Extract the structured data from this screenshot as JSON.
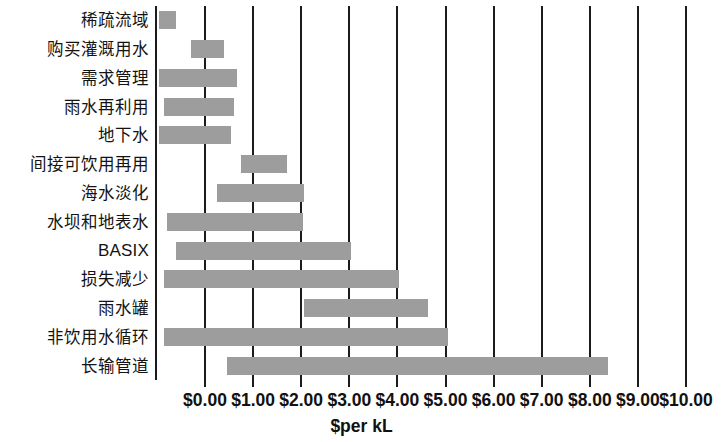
{
  "chart_data": {
    "type": "bar",
    "orientation": "horizontal",
    "title": "",
    "xlabel": "$per kL",
    "ylabel": "",
    "xlim": [
      0,
      10
    ],
    "xticks": [
      0,
      1,
      2,
      3,
      4,
      5,
      6,
      7,
      8,
      9,
      10
    ],
    "xtick_labels": [
      "$0.00",
      "$1.00",
      "$2.00",
      "$3.00",
      "$4.00",
      "$5.00",
      "$6.00",
      "$7.00",
      "$8.00",
      "$9.00",
      "$10.00"
    ],
    "grid": true,
    "grid_axis": "x",
    "legend": false,
    "bar_color": "#9d9d9d",
    "note": "Floating (range) bars: each category spans a low-to-high cost range; some ranges extend below $0.00 and are clipped at the left spine.",
    "categories": [
      "稀疏流域",
      "购买灌溉用水",
      "需求管理",
      "雨水再利用",
      "地下水",
      "间接可饮用再用",
      "海水淡化",
      "水坝和地表水",
      "BASIX",
      "损失减少",
      "雨水罐",
      "非饮用水循环",
      "长输管道"
    ],
    "ranges": [
      {
        "category": "稀疏流域",
        "low": -0.95,
        "high": -0.6
      },
      {
        "category": "购买灌溉用水",
        "low": -0.3,
        "high": 0.4
      },
      {
        "category": "需求管理",
        "low": -0.95,
        "high": 0.66
      },
      {
        "category": "雨水再利用",
        "low": -0.85,
        "high": 0.6
      },
      {
        "category": "地下水",
        "low": -0.95,
        "high": 0.54
      },
      {
        "category": "间接可饮用再用",
        "low": 0.75,
        "high": 1.7
      },
      {
        "category": "海水淡化",
        "low": 0.25,
        "high": 2.05
      },
      {
        "category": "水坝和地表水",
        "low": -0.8,
        "high": 2.04
      },
      {
        "category": "BASIX",
        "low": -0.6,
        "high": 3.03
      },
      {
        "category": "损失减少",
        "low": -0.86,
        "high": 4.04
      },
      {
        "category": "雨水罐",
        "low": 2.06,
        "high": 4.64
      },
      {
        "category": "非饮用水循环",
        "low": -0.86,
        "high": 5.06
      },
      {
        "category": "长输管道",
        "low": 0.46,
        "high": 8.37
      }
    ]
  }
}
